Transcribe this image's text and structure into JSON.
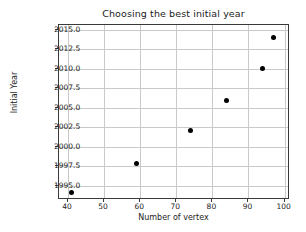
{
  "chart_data": {
    "type": "scatter",
    "title": "Choosing the best initial year",
    "xlabel": "Number of vertex",
    "ylabel": "Initial Year",
    "xlim": [
      37.5,
      101.5
    ],
    "ylim": [
      1993.2,
      2015.6
    ],
    "xticks": [
      40,
      50,
      60,
      70,
      80,
      90,
      100
    ],
    "xtick_labels": [
      "40",
      "50",
      "60",
      "70",
      "80",
      "90",
      "100"
    ],
    "yticks": [
      1995.0,
      1997.5,
      2000.0,
      2002.5,
      2005.0,
      2007.5,
      2010.0,
      2012.5,
      2015.0
    ],
    "ytick_labels": [
      "1995.0",
      "1997.5",
      "2000.0",
      "2002.5",
      "2005.0",
      "2007.5",
      "2010.0",
      "2012.5",
      "2015.0"
    ],
    "grid": true,
    "legend": "none",
    "marker": "filled-circle",
    "marker_color": "#000000",
    "points": [
      {
        "x": 41,
        "y": 1994.1
      },
      {
        "x": 59,
        "y": 1997.9
      },
      {
        "x": 74,
        "y": 2002.1
      },
      {
        "x": 84,
        "y": 2005.9
      },
      {
        "x": 94,
        "y": 2010.0
      },
      {
        "x": 97,
        "y": 2014.0
      }
    ],
    "x": [
      41,
      59,
      74,
      84,
      94,
      97
    ],
    "values": [
      1994.1,
      1997.9,
      2002.1,
      2005.9,
      2010.0,
      2014.0
    ]
  },
  "colors": {
    "background": "#ffffff",
    "grid": "#c9c9c9",
    "axis": "#3a3a3a",
    "text": "#1c1c1c",
    "marker": "#000000"
  }
}
